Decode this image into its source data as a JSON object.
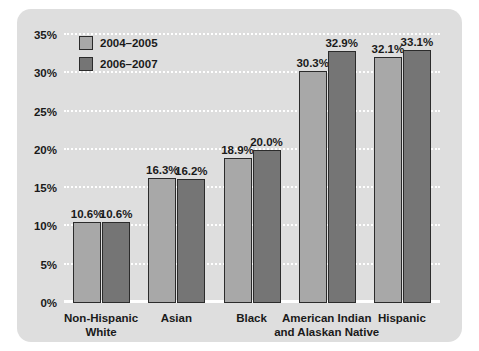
{
  "chart_data": {
    "type": "bar",
    "title": "",
    "xlabel": "",
    "ylabel": "",
    "ylim": [
      0,
      35
    ],
    "grid": true,
    "legend_position": "top-left",
    "categories": [
      "Non-Hispanic White",
      "Asian",
      "Black",
      "American Indian and Alaskan Native",
      "Hispanic"
    ],
    "category_lines": [
      [
        "Non-Hispanic",
        "White"
      ],
      [
        "Asian"
      ],
      [
        "Black"
      ],
      [
        "American Indian",
        "and Alaskan Native"
      ],
      [
        "Hispanic"
      ]
    ],
    "series": [
      {
        "name": "2004–2005",
        "color": "#a8a8a8",
        "values": [
          10.6,
          16.3,
          18.9,
          30.3,
          32.1
        ],
        "labels": [
          "10.6%",
          "16.3%",
          "18.9%",
          "30.3%",
          "32.1%"
        ]
      },
      {
        "name": "2006–2007",
        "color": "#757575",
        "values": [
          10.6,
          16.2,
          20.0,
          32.9,
          33.1
        ],
        "labels": [
          "10.6%",
          "16.2%",
          "20.0%",
          "32.9%",
          "33.1%"
        ]
      }
    ],
    "yticks": [
      0,
      5,
      10,
      15,
      20,
      25,
      30,
      35
    ],
    "ytick_labels": [
      "0%",
      "5%",
      "10%",
      "15%",
      "20%",
      "25%",
      "30%",
      "35%"
    ]
  },
  "legend": {
    "items": [
      {
        "label": "2004–2005"
      },
      {
        "label": "2006–2007"
      }
    ]
  },
  "colors": {
    "panel_background": "#dedede",
    "gridline": "#ffffff",
    "series_1": "#a8a8a8",
    "series_2": "#757575",
    "bar_outline": "#2b2b2b",
    "text": "#1a1a1a"
  }
}
